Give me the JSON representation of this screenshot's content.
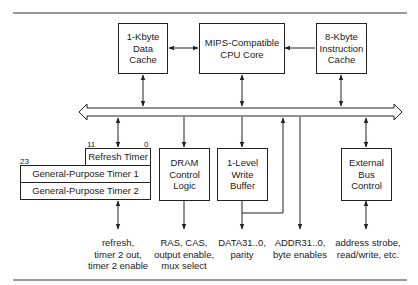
{
  "diagram": {
    "type": "block-diagram",
    "blocks": {
      "data_cache": "1-Kbyte\nData\nCache",
      "cpu_core": "MIPS-Compatible\nCPU Core",
      "instruction_cache": "8-Kbyte\nInstruction\nCache",
      "refresh_timer": "Refresh Timer",
      "gp_timer_1": "General-Purpose Timer 1",
      "gp_timer_2": "General-Purpose Timer 2",
      "dram_control": "DRAM\nControl\nLogic",
      "write_buffer": "1-Level\nWrite\nBuffer",
      "external_bus": "External\nBus\nControl"
    },
    "bit_labels": {
      "refresh_msb": "11",
      "refresh_lsb": "0",
      "gp_msb": "23"
    },
    "signal_labels": {
      "timers": "refresh,\ntimer 2 out,\ntimer 2 enable",
      "dram": "RAS, CAS,\noutput enable,\nmux select",
      "data": "DATA31..0,\nparity",
      "addr": "ADDR31..0,\nbyte enables",
      "bus": "address strobe,\nread/write, etc."
    },
    "connections": [
      {
        "from": "data_cache",
        "to": "cpu_core",
        "direction": "bidirectional"
      },
      {
        "from": "instruction_cache",
        "to": "cpu_core",
        "direction": "one-way"
      },
      {
        "from": "data_cache",
        "to": "internal_bus",
        "direction": "bidirectional"
      },
      {
        "from": "cpu_core",
        "to": "internal_bus",
        "direction": "bidirectional"
      },
      {
        "from": "instruction_cache",
        "to": "internal_bus",
        "direction": "bidirectional"
      },
      {
        "from": "internal_bus",
        "to": "refresh_timer",
        "direction": "bidirectional"
      },
      {
        "from": "internal_bus",
        "to": "dram_control",
        "direction": "one-way"
      },
      {
        "from": "internal_bus",
        "to": "write_buffer",
        "direction": "one-way"
      },
      {
        "from": "external_bus",
        "to": "internal_bus",
        "direction": "bidirectional"
      }
    ]
  }
}
